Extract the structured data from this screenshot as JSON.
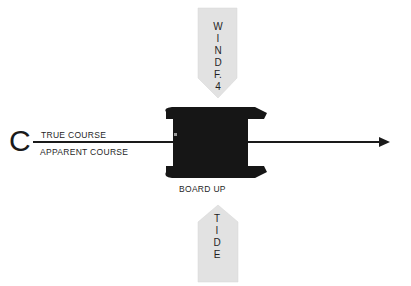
{
  "diagram": {
    "origin_label": "C",
    "course_line": {
      "upper_label": "TRUE  COURSE",
      "lower_label": "APPARENT COURSE"
    },
    "boat": {
      "label": "BOARD UP"
    },
    "wind_arrow": {
      "letters": [
        "W",
        "I",
        "N",
        "D",
        "F.",
        "4"
      ],
      "label": "WIND F. 4"
    },
    "tide_arrow": {
      "letters": [
        "T",
        "I",
        "D",
        "E"
      ],
      "label": "TIDE"
    },
    "colors": {
      "boat_fill": "#161616",
      "arrow_fill": "#e2e2e2",
      "line": "#1a1a1a",
      "background": "#ffffff"
    }
  }
}
